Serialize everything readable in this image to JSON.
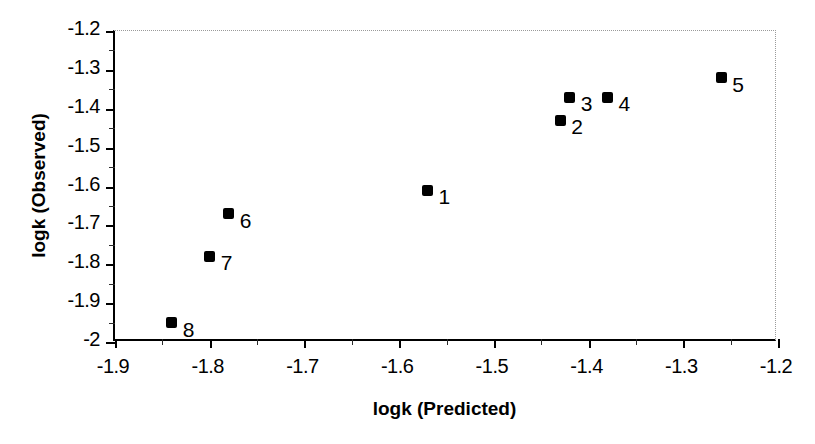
{
  "chart_data": {
    "type": "scatter",
    "title": "",
    "xlabel": "logk (Predicted)",
    "ylabel": "logk (Observed)",
    "xlim": [
      -1.9,
      -1.2
    ],
    "ylim": [
      -2.0,
      -1.2
    ],
    "xticks": [
      "-1.9",
      "-1.8",
      "-1.7",
      "-1.6",
      "-1.5",
      "-1.4",
      "-1.3",
      "-1.2"
    ],
    "xtick_values": [
      -1.9,
      -1.8,
      -1.7,
      -1.6,
      -1.5,
      -1.4,
      -1.3,
      -1.2
    ],
    "yticks": [
      "-1.2",
      "-1.3",
      "-1.4",
      "-1.5",
      "-1.6",
      "-1.7",
      "-1.8",
      "-1.9",
      "-2"
    ],
    "ytick_values": [
      -1.2,
      -1.3,
      -1.4,
      -1.5,
      -1.6,
      -1.7,
      -1.8,
      -1.9,
      -2.0
    ],
    "minor_tick_step": 0.05,
    "grid": false,
    "legend": false,
    "marker_color": "#000000",
    "marker_shape": "square",
    "points": [
      {
        "label": "1",
        "x": -1.57,
        "y": -1.61
      },
      {
        "label": "2",
        "x": -1.43,
        "y": -1.43
      },
      {
        "label": "3",
        "x": -1.42,
        "y": -1.37
      },
      {
        "label": "4",
        "x": -1.38,
        "y": -1.37
      },
      {
        "label": "5",
        "x": -1.26,
        "y": -1.32
      },
      {
        "label": "6",
        "x": -1.78,
        "y": -1.67
      },
      {
        "label": "7",
        "x": -1.8,
        "y": -1.78
      },
      {
        "label": "8",
        "x": -1.84,
        "y": -1.95
      }
    ]
  }
}
